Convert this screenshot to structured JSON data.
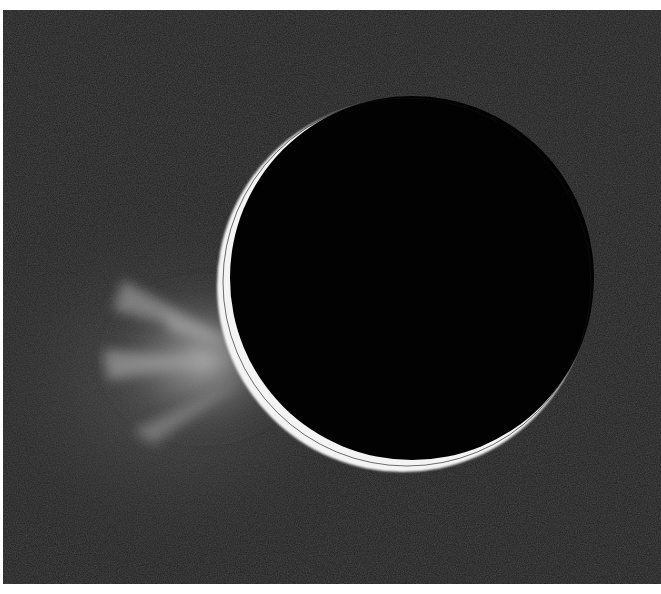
{
  "image": {
    "subject": "Backlit crescent moon with plumes",
    "description": "Dark moon disk with a thin bright crescent along its lower-left limb and diffuse jets/plumes spraying outward to the left, against a dark grainy background",
    "colors": {
      "background": "#1e1e1e",
      "disk": "#000000",
      "crescent": "#ffffff",
      "plume": "#9a9a9a",
      "border": "#ffffff"
    }
  }
}
